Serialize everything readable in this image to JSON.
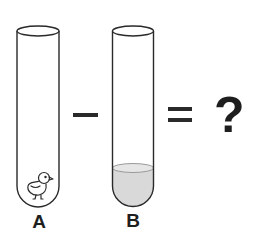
{
  "diagram": {
    "tube_a": {
      "label": "A",
      "content": "chick-icon"
    },
    "tube_b": {
      "label": "B",
      "content": "liquid"
    },
    "operator_minus": "−",
    "operator_equals": "=",
    "result": "?",
    "colors": {
      "outline": "#2a2a2a",
      "liquid_fill": "#d9d9d9",
      "liquid_surface": "#e6e6e6",
      "text": "#1e1e1e",
      "background": "#ffffff"
    }
  }
}
